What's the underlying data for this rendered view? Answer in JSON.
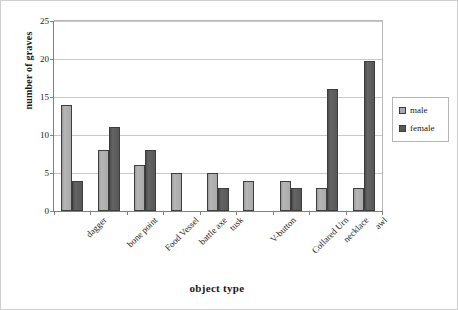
{
  "chart_data": {
    "type": "bar",
    "title": "",
    "xlabel": "object type",
    "ylabel": "number of graves",
    "ylim": [
      0,
      25
    ],
    "yticks": [
      0,
      5,
      10,
      15,
      20,
      25
    ],
    "grid": true,
    "legend_position": "right",
    "categories": [
      "dagger",
      "bone point",
      "Food Vessel",
      "battle axe",
      "tusk",
      "V-button",
      "Collared Urn",
      "necklace",
      "awl"
    ],
    "series": [
      {
        "name": "male",
        "color": "#aaaaaa",
        "values": [
          14,
          8,
          6,
          5,
          5,
          4,
          4,
          3,
          3
        ]
      },
      {
        "name": "female",
        "color": "#585858",
        "values": [
          4,
          11,
          8,
          0,
          3,
          0,
          3,
          16,
          19.8
        ]
      }
    ]
  },
  "legend": {
    "items": [
      {
        "label": "male"
      },
      {
        "label": "female"
      }
    ]
  }
}
